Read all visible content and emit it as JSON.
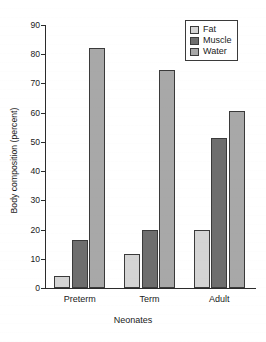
{
  "chart_data": {
    "type": "bar",
    "title": "",
    "xlabel": "Neonates",
    "ylabel": "Body composition (percent)",
    "categories": [
      "Preterm",
      "Term",
      "Adult"
    ],
    "series": [
      {
        "name": "Fat",
        "values": [
          4,
          11.8,
          19.7
        ],
        "color": "#d4d4d4"
      },
      {
        "name": "Muscle",
        "values": [
          16.5,
          19.8,
          51.5
        ],
        "color": "#6e6e6e"
      },
      {
        "name": "Water",
        "values": [
          82,
          74.5,
          60.5
        ],
        "color": "#a8a8a8"
      }
    ],
    "ylim": [
      0,
      90
    ],
    "yticks": [
      0,
      10,
      20,
      30,
      40,
      50,
      60,
      70,
      80,
      90
    ],
    "ytick_labels": [
      "0",
      "10",
      "20",
      "30",
      "40",
      "50",
      "60",
      "70",
      "80",
      "90"
    ],
    "grid": false,
    "legend_position": "top-right",
    "legend_entries": [
      "Fat",
      "Muscle",
      "Water"
    ],
    "bar_edge_color": "#3a3a3a",
    "axis_color": "#2b2b2b",
    "background_color": "#ffffff"
  }
}
